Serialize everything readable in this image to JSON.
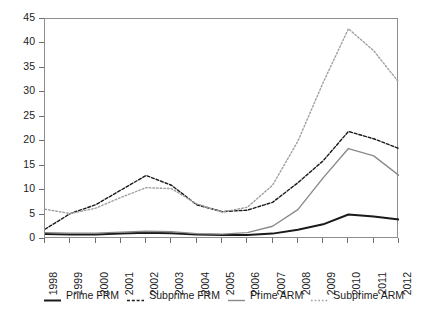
{
  "chart_data": {
    "type": "line",
    "title": "",
    "subtitle": "",
    "xlabel": "",
    "ylabel": "",
    "x": [
      1998,
      1999,
      2000,
      2001,
      2002,
      2003,
      2004,
      2005,
      2006,
      2007,
      2008,
      2009,
      2010,
      2011,
      2012
    ],
    "xtick_labels": [
      "1998",
      "1999",
      "2000",
      "2001",
      "2002",
      "2003",
      "2004",
      "2005",
      "2006",
      "2007",
      "2008",
      "2009",
      "2010",
      "2011",
      "2012"
    ],
    "ytick_labels": [
      "0",
      "5",
      "10",
      "15",
      "20",
      "25",
      "30",
      "35",
      "40",
      "45"
    ],
    "ytick_values": [
      0,
      5,
      10,
      15,
      20,
      25,
      30,
      35,
      40,
      45
    ],
    "ylim": [
      0,
      45
    ],
    "xlim": [
      1998,
      2012
    ],
    "grid": false,
    "legend_position": "below",
    "series": [
      {
        "name": "Prime FRM",
        "style": "solid",
        "color": "#1a1a1a",
        "width": 2.0,
        "values": [
          1.0,
          0.9,
          0.9,
          1.1,
          1.3,
          1.2,
          0.9,
          0.8,
          0.8,
          1.1,
          1.9,
          3.0,
          5.0,
          4.6,
          4.0
        ]
      },
      {
        "name": "Subprime FRM",
        "style": "dashed",
        "color": "#1a1a1a",
        "width": 1.4,
        "values": [
          2.0,
          5.2,
          7.0,
          10.0,
          13.0,
          11.0,
          7.0,
          5.6,
          5.9,
          7.5,
          11.5,
          16.0,
          22.0,
          20.5,
          18.5
        ]
      },
      {
        "name": "Prime ARM",
        "style": "solid",
        "color": "#8a8a8a",
        "width": 1.4,
        "values": [
          1.3,
          1.2,
          1.2,
          1.4,
          1.6,
          1.5,
          1.1,
          1.0,
          1.3,
          2.6,
          6.0,
          12.5,
          18.5,
          17.0,
          13.0
        ]
      },
      {
        "name": "Subprime ARM",
        "style": "dotted",
        "color": "#a0a0a0",
        "width": 1.4,
        "values": [
          6.1,
          5.2,
          6.3,
          8.5,
          10.5,
          10.3,
          7.2,
          5.5,
          6.5,
          11.0,
          20.0,
          32.0,
          43.0,
          38.5,
          32.0
        ]
      }
    ]
  },
  "legend": {
    "items": [
      {
        "label": "Prime FRM"
      },
      {
        "label": "Subprime FRM"
      },
      {
        "label": "Prime ARM"
      },
      {
        "label": "Subprime ARM"
      }
    ]
  }
}
